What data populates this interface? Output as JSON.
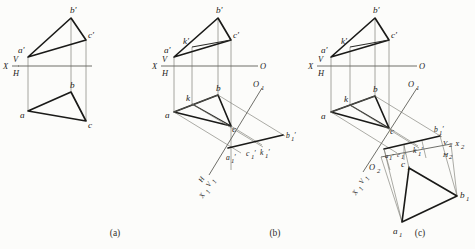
{
  "figure": {
    "type": "descriptive-geometry-projection-diagram",
    "background_color": "#fcfcfa",
    "line_color": "#1a1a18",
    "thin_line_color": "#6f6f69",
    "panel_count": 3
  },
  "captions": {
    "a": "(a)",
    "b": "(b)",
    "c": "(c)"
  },
  "panel_a": {
    "caption": "(a)",
    "axis": {
      "x_label": "X",
      "v_label": "V",
      "h_label": "H"
    },
    "frontal_view_labels": {
      "a_prime": "a'",
      "b_prime": "b'",
      "c_prime": "c'"
    },
    "horizontal_view_labels": {
      "a": "a",
      "b": "b",
      "c": "c"
    }
  },
  "panel_b": {
    "caption": "(b)",
    "axis": {
      "x_label": "X",
      "v_label": "V",
      "h_label": "H",
      "o_label": "O"
    },
    "aux_axis": {
      "o1_label": "O",
      "o1_sub": "1",
      "x1_label": "X",
      "x1_sub": "1",
      "v1_label": "V",
      "v1_sub": "1",
      "h_label": "H"
    },
    "frontal_view_labels": {
      "a_prime": "a'",
      "b_prime": "b'",
      "c_prime": "c'",
      "k_prime": "k'"
    },
    "horizontal_view_labels": {
      "a": "a",
      "b": "b",
      "c": "c",
      "k": "k"
    },
    "aux_view_labels": {
      "a1_prime": "a",
      "a1_sub": "1",
      "b1_prime": "b",
      "b1_sub": "1",
      "c1_prime": "c",
      "c1_sub": "1",
      "k1_prime": "k",
      "k1_sub": "1"
    }
  },
  "panel_c": {
    "caption": "(c)",
    "axis": {
      "x_label": "X",
      "v_label": "V",
      "h_label": "H",
      "o_label": "O"
    },
    "aux_axis_1": {
      "o1_label": "O",
      "o1_sub": "1",
      "x1_label": "X",
      "x1_sub": "1",
      "v1_label": "V",
      "v1_sub": "1"
    },
    "aux_axis_2": {
      "o2_label": "O",
      "o2_sub": "2",
      "x2_label": "X",
      "x2_sub": "2",
      "v2_label": "V",
      "v2_sub": "2",
      "h2_label": "H",
      "h2_sub": "2"
    },
    "frontal_view_labels": {
      "a_prime": "a'",
      "b_prime": "b'",
      "c_prime": "c'",
      "k_prime": "k'"
    },
    "horizontal_view_labels": {
      "a": "a",
      "b": "b",
      "c": "c",
      "k": "k"
    },
    "aux_view_1_labels": {
      "a1_prime": "a",
      "a1_sub": "1",
      "b1_prime": "b",
      "b1_sub": "1",
      "c1_prime": "c",
      "c1_sub": "1",
      "k1_prime": "k",
      "k1_sub": "1"
    },
    "aux_view_2_labels": {
      "a1": "a",
      "a1_sub": "1",
      "b1": "b",
      "b1_sub": "1",
      "c1": "c",
      "c1_sub": "1"
    }
  }
}
